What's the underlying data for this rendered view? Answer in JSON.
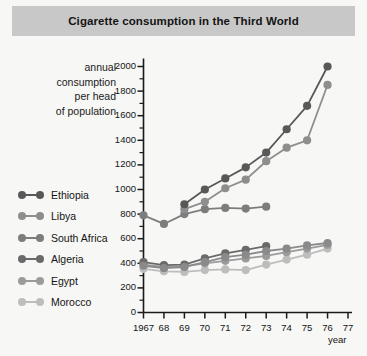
{
  "header": {
    "title": "Cigarette consumption in the Third World"
  },
  "axis_title_lines": [
    "annual",
    "consumption",
    "per head",
    "of population"
  ],
  "legend": {
    "items": [
      {
        "label": "Ethiopia",
        "color": "#585858"
      },
      {
        "label": "Libya",
        "color": "#8e8e8e"
      },
      {
        "label": "South Africa",
        "color": "#7d7d7d"
      },
      {
        "label": "Algeria",
        "color": "#6a6a6a"
      },
      {
        "label": "Egypt",
        "color": "#9b9b9b"
      },
      {
        "label": "Morocco",
        "color": "#bdbdbd"
      }
    ]
  },
  "colors": {
    "title_band": "#c8c8c8",
    "background": "#f7f7f5",
    "axis": "#1a1a1a"
  },
  "chart_data": {
    "type": "line",
    "title": "Cigarette consumption in the Third World",
    "xlabel": "year",
    "ylabel": "annual consumption per head of population",
    "x": [
      1967,
      1968,
      1969,
      1970,
      1971,
      1972,
      1973,
      1974,
      1975,
      1976
    ],
    "xtick_labels": [
      "1967",
      "68",
      "69",
      "70",
      "71",
      "72",
      "73",
      "74",
      "75",
      "76",
      "77"
    ],
    "xlim": [
      1967,
      1977
    ],
    "ylim": [
      0,
      2000
    ],
    "ytick_labels": [
      "0",
      "200",
      "400",
      "600",
      "800",
      "1000",
      "1200",
      "1400",
      "1600",
      "1800",
      "2000"
    ],
    "ytick_step": 200,
    "yminor_step": 100,
    "grid": false,
    "legend_position": "left",
    "series": [
      {
        "name": "Ethiopia",
        "color": "#585858",
        "values": [
          null,
          null,
          880,
          1000,
          1090,
          1180,
          1300,
          1490,
          1680,
          2000
        ]
      },
      {
        "name": "Libya",
        "color": "#8e8e8e",
        "values": [
          null,
          null,
          840,
          900,
          1010,
          1080,
          1230,
          1340,
          1400,
          1850
        ]
      },
      {
        "name": "South Africa",
        "color": "#7d7d7d",
        "values": [
          790,
          720,
          800,
          840,
          850,
          845,
          860,
          null,
          null,
          null
        ]
      },
      {
        "name": "Algeria",
        "color": "#6a6a6a",
        "values": [
          410,
          385,
          390,
          440,
          480,
          510,
          540,
          null,
          null,
          null
        ]
      },
      {
        "name": "Egypt",
        "color": "#9b9b9b",
        "values": [
          390,
          370,
          375,
          400,
          420,
          440,
          460,
          490,
          520,
          550
        ]
      },
      {
        "name": "Morocco",
        "color": "#bdbdbd",
        "values": [
          355,
          335,
          330,
          345,
          350,
          345,
          390,
          430,
          470,
          520
        ]
      }
    ],
    "series_extra": [
      {
        "name": "Egypt-mid",
        "color": "#8a8a8a",
        "values": [
          380,
          360,
          370,
          410,
          450,
          470,
          500,
          520,
          545,
          565
        ]
      }
    ]
  }
}
